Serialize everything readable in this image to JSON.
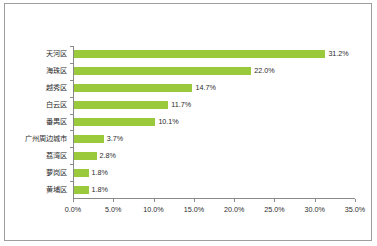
{
  "chart_data": {
    "type": "bar",
    "orientation": "horizontal",
    "title": "",
    "subtitle": "",
    "xlabel": "",
    "ylabel": "",
    "xlim": [
      0,
      35
    ],
    "xtick_step": 5,
    "grid": false,
    "legend": false,
    "legend_position": "none",
    "bar_color": "#9ac93c",
    "axis_color": "#8a8a8a",
    "frame_color": "#9d9d9d",
    "background_color": "#ffffff",
    "categories": [
      "天河区",
      "海珠区",
      "越秀区",
      "白云区",
      "番禺区",
      "广州周边城市",
      "荔湾区",
      "萝岗区",
      "黄埔区"
    ],
    "values": [
      31.2,
      22.0,
      14.7,
      11.7,
      10.1,
      3.7,
      2.8,
      1.8,
      1.8
    ],
    "value_labels": [
      "31.2%",
      "22.0%",
      "14.7%",
      "11.7%",
      "10.1%",
      "3.7%",
      "2.8%",
      "1.8%",
      "1.8%"
    ],
    "xtick_labels": [
      "0.0%",
      "5.0%",
      "10.0%",
      "15.0%",
      "20.0%",
      "25.0%",
      "30.0%",
      "35.0%"
    ],
    "xtick_values": [
      0,
      5,
      10,
      15,
      20,
      25,
      30,
      35
    ]
  }
}
